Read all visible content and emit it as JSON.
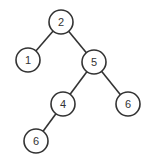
{
  "tree": {
    "nodes": [
      {
        "id": "n2",
        "label": "2",
        "x": 61,
        "y": 22
      },
      {
        "id": "n1",
        "label": "1",
        "x": 28,
        "y": 60
      },
      {
        "id": "n5",
        "label": "5",
        "x": 94,
        "y": 62
      },
      {
        "id": "n4",
        "label": "4",
        "x": 63,
        "y": 104
      },
      {
        "id": "n6r",
        "label": "6",
        "x": 128,
        "y": 104
      },
      {
        "id": "n6l",
        "label": "6",
        "x": 36,
        "y": 141
      }
    ],
    "edges": [
      [
        "n2",
        "n1"
      ],
      [
        "n2",
        "n5"
      ],
      [
        "n5",
        "n4"
      ],
      [
        "n5",
        "n6r"
      ],
      [
        "n4",
        "n6l"
      ]
    ],
    "colors": {
      "stroke": "#333333",
      "fill": "#ffffff"
    }
  }
}
